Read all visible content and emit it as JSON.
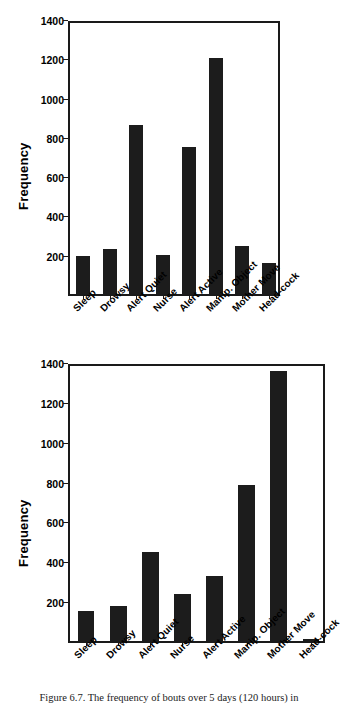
{
  "figure": {
    "caption": "Figure 6.7.  The frequency of bouts over 5 days (120 hours) in"
  },
  "chart_data": [
    {
      "id": "top",
      "type": "bar",
      "title": "",
      "xlabel": "",
      "ylabel": "Frequency",
      "ylim": [
        0,
        1400
      ],
      "yticks": [
        200,
        400,
        600,
        800,
        1000,
        1200,
        1400
      ],
      "ytick_labels": [
        "200",
        "400",
        "600",
        "800",
        "1000",
        "1200",
        "1400"
      ],
      "grid": false,
      "legend": false,
      "bar_color": "#1c1c1c",
      "categories": [
        "Sleep",
        "Drowsy",
        "Alert Quiet",
        "Nurse",
        "Alert Active",
        "Manip. Object",
        "Mother Move",
        "Head-cock"
      ],
      "values": [
        195,
        230,
        860,
        200,
        750,
        1200,
        245,
        160
      ]
    },
    {
      "id": "bottom",
      "type": "bar",
      "title": "",
      "xlabel": "",
      "ylabel": "Frequency",
      "ylim": [
        0,
        1400
      ],
      "yticks": [
        200,
        400,
        600,
        800,
        1000,
        1200,
        1400
      ],
      "ytick_labels": [
        "200",
        "400",
        "600",
        "800",
        "1000",
        "1200",
        "1400"
      ],
      "grid": false,
      "legend": false,
      "bar_color": "#1c1c1c",
      "categories": [
        "Sleep",
        "Drowsy",
        "Alert Quiet",
        "Nurse",
        "Alert Active",
        "Manip. Object",
        "Mother Move",
        "Head-cock"
      ],
      "values": [
        150,
        175,
        448,
        235,
        328,
        785,
        1355,
        10
      ]
    }
  ]
}
